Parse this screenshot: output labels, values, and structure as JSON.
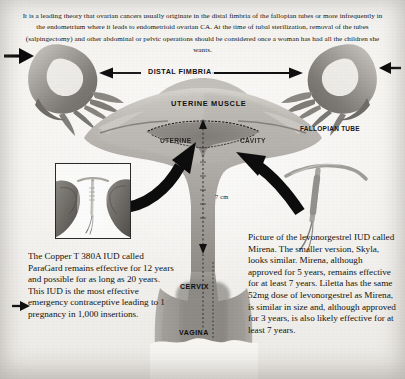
{
  "document": {
    "title": "Fallopian tube and uterus anatomy with IUD placement diagram",
    "kind": "medical-illustration"
  },
  "intro": {
    "text": "It is a leading theory that ovarian cancers usually originate in the distal fimbria of the fallopian tubes or more infrequently in the endometrium where it leads to endometrioid ovarian CA. At the time of tubal sterilization, removal of the tubes (salpingectomy) and other abdominal or pelvic operations should be considered once a woman has had all the children she wants."
  },
  "labels": {
    "distal_fimbria": "DISTAL FIMBRIA",
    "uterine_muscle": "UTERINE  MUSCLE",
    "uterine_cavity_left": "UTERINE",
    "uterine_cavity_right": "CAVITY",
    "fallopian_tube": "FALLOPIAN TUBE",
    "cervix": "CERVIX",
    "vagina": "VAGINA",
    "measurement": "7 cm"
  },
  "blurb_left": {
    "text": "The Copper T 380A IUD called ParaGard remains effective for 12 years and possible for as long as 20 years. This IUD is the most effective emergency contraceptive leading to 1 pregnancy in 1,000 insertions."
  },
  "blurb_right": {
    "text": "Picture of the levonorgestrel IUD called Mirena. The smaller version, Skyla, looks similar. Mirena, although approved for 5 years, remains effective for at least 7 years. Liletta has the same 52mg dose of levonorgestrel as Mirena, is similar in size and, although approved for 3 years, is also likely effective for at least 7 years."
  },
  "icons": {
    "left_edge_arrow": "arrow-right-icon",
    "right_edge_arrow": "arrow-left-icon",
    "fimbria_span_arrow": "double-headed-arrow-icon",
    "paragard_pointer": "curved-arrow-right-icon",
    "mirena_pointer": "curved-arrow-left-icon",
    "cavity_depth_arrow": "arrow-down-icon",
    "fundus_arrow": "arrow-up-icon"
  },
  "colors": {
    "paper": "#f4f3f0",
    "ink": "#141210",
    "arrow": "#111111",
    "tissue_mid": "#9d9a95",
    "tissue_dark": "#6e6b67",
    "tissue_light": "#c9c6c1",
    "cavity": "#8b8783"
  }
}
